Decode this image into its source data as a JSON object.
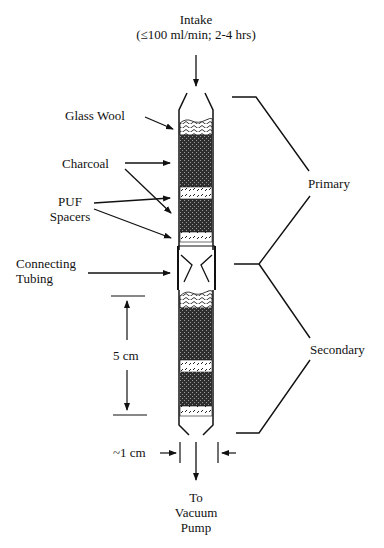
{
  "diagram": {
    "labels": {
      "intake_line1": "Intake",
      "intake_line2": "(≤100 ml/min; 2-4 hrs)",
      "glass_wool": "Glass Wool",
      "charcoal": "Charcoal",
      "puf_line1": "PUF",
      "puf_line2": "Spacers",
      "connecting_line1": "Connecting",
      "connecting_line2": "Tubing",
      "scale": "5 cm",
      "width": "~1 cm",
      "outlet_line1": "To",
      "outlet_line2": "Vacuum",
      "outlet_line3": "Pump",
      "primary": "Primary",
      "secondary": "Secondary"
    },
    "sections": [
      {
        "name": "Primary",
        "layers": [
          "Glass Wool",
          "Charcoal",
          "PUF Spacer",
          "Charcoal",
          "PUF Spacer"
        ]
      },
      {
        "name": "Secondary",
        "layers": [
          "Glass Wool",
          "Charcoal",
          "PUF Spacer",
          "Charcoal",
          "PUF Spacer"
        ]
      }
    ],
    "colors": {
      "line": "#111111",
      "charcoal": "#3a3a3a",
      "background": "#ffffff"
    }
  }
}
